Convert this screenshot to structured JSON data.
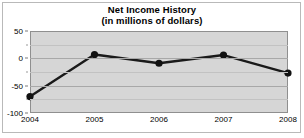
{
  "chart_data": {
    "type": "line",
    "title": "Net Income History",
    "subtitle": "(in millions of dollars)",
    "xlabel": "",
    "ylabel": "",
    "categories": [
      "2004",
      "2005",
      "2006",
      "2007",
      "2008"
    ],
    "x": [
      2004,
      2005,
      2006,
      2007,
      2008
    ],
    "values": [
      -70,
      7,
      -9,
      6,
      -27
    ],
    "series": [
      {
        "name": "Net Income",
        "values": [
          -70,
          7,
          -9,
          6,
          -27
        ]
      }
    ],
    "ylim": [
      -100,
      50
    ],
    "xlim": [
      2004,
      2008
    ],
    "ytick_labels": [
      "50",
      "0",
      "-50",
      "-100"
    ],
    "ytick_values": [
      50,
      0,
      -50,
      -100
    ],
    "yminor_values": [
      25,
      -25,
      -75
    ],
    "xtick_labels": [
      "2004",
      "2005",
      "2006",
      "2007",
      "2008"
    ],
    "grid": true,
    "legend": false,
    "legend_position": "none",
    "marker": "circle",
    "line_color": "#1a1a1a",
    "marker_color": "#111111",
    "plot_background": "#d6d6d6",
    "figure_background": "#ffffff",
    "grid_color": "#a8a8a8"
  }
}
